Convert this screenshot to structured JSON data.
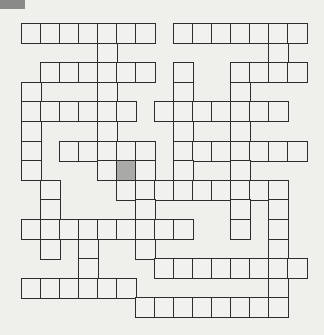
{
  "puzzle": {
    "type": "crossword",
    "columns": 15,
    "rows": 15,
    "cell_width": 19,
    "cell_height": 19.6,
    "colors": {
      "background": "#efefec",
      "cell_fill": "#f1f1ef",
      "cell_border": "#2e2e2e",
      "shaded_cell": "#a9a9a7",
      "corner_tab": "#8a8a88"
    },
    "white_cells_by_row": [
      [
        0,
        1,
        2,
        3,
        4,
        5,
        6,
        8,
        9,
        10,
        11,
        12,
        13,
        14
      ],
      [
        4,
        13
      ],
      [
        1,
        2,
        3,
        4,
        5,
        6,
        8,
        11,
        12,
        13,
        14
      ],
      [
        0,
        4,
        8,
        11
      ],
      [
        0,
        1,
        2,
        3,
        4,
        5,
        7,
        8,
        9,
        10,
        11,
        12,
        13
      ],
      [
        0,
        4,
        8,
        11
      ],
      [
        0,
        2,
        3,
        4,
        5,
        6,
        8,
        9,
        10,
        11,
        12,
        13,
        14
      ],
      [
        0,
        4,
        5,
        6,
        8,
        11
      ],
      [
        1,
        5,
        6,
        7,
        8,
        9,
        10,
        11,
        12,
        13
      ],
      [
        1,
        6,
        11,
        13
      ],
      [
        0,
        1,
        2,
        3,
        4,
        5,
        6,
        7,
        8,
        11,
        13
      ],
      [
        1,
        3,
        6,
        13
      ],
      [
        3,
        7,
        8,
        9,
        10,
        11,
        12,
        13,
        14
      ],
      [
        0,
        1,
        2,
        3,
        4,
        5,
        13
      ],
      [
        6,
        7,
        8,
        9,
        10,
        11,
        12,
        13
      ]
    ],
    "shaded_cells": [
      {
        "row": 7,
        "col": 5
      }
    ]
  }
}
